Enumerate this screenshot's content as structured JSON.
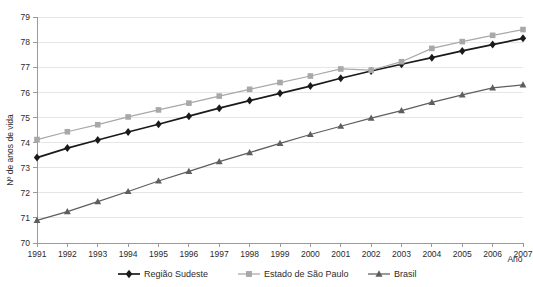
{
  "chart_data": {
    "type": "line",
    "title": "",
    "xlabel": "Ano",
    "ylabel": "Nº de anos de vida",
    "categories": [
      "1991",
      "1992",
      "1993",
      "1994",
      "1995",
      "1996",
      "1997",
      "1998",
      "1999",
      "2000",
      "2001",
      "2002",
      "2003",
      "2004",
      "2005",
      "2006",
      "2007"
    ],
    "x": [
      1991,
      1992,
      1993,
      1994,
      1995,
      1996,
      1997,
      1998,
      1999,
      2000,
      2001,
      2002,
      2003,
      2004,
      2005,
      2006,
      2007
    ],
    "ylim": [
      70,
      79
    ],
    "xlim": [
      1991,
      2007
    ],
    "yticks": [
      "70",
      "71",
      "72",
      "73",
      "74",
      "75",
      "76",
      "77",
      "78",
      "79"
    ],
    "grid": "horizontal",
    "legend_position": "bottom",
    "series": [
      {
        "name": "Região Sudeste",
        "marker": "diamond",
        "color": "#1a1a1a",
        "values": [
          73.4,
          73.78,
          74.1,
          74.42,
          74.73,
          75.05,
          75.37,
          75.67,
          75.96,
          76.25,
          76.56,
          76.85,
          77.12,
          77.38,
          77.65,
          77.9,
          78.15
        ]
      },
      {
        "name": "Estado de São Paulo",
        "marker": "square",
        "color": "#a8a8a8",
        "values": [
          74.12,
          74.43,
          74.71,
          75.02,
          75.3,
          75.57,
          75.85,
          76.12,
          76.39,
          76.65,
          76.93,
          76.88,
          77.22,
          77.75,
          78.02,
          78.27,
          78.5
        ]
      },
      {
        "name": "Brasil",
        "marker": "triangle",
        "color": "#5e5e5e",
        "values": [
          70.9,
          71.25,
          71.65,
          72.05,
          72.47,
          72.85,
          73.24,
          73.6,
          73.97,
          74.32,
          74.65,
          74.97,
          75.27,
          75.6,
          75.9,
          76.18,
          76.3
        ]
      }
    ]
  },
  "axes": {
    "y_label": "Nº de anos de vida",
    "x_label": "Ano"
  },
  "legend": {
    "items": [
      {
        "label": "Região Sudeste",
        "marker": "diamond-marker",
        "color": "#1a1a1a"
      },
      {
        "label": "Estado de São Paulo",
        "marker": "square-marker",
        "color": "#a8a8a8"
      },
      {
        "label": "Brasil",
        "marker": "triangle-marker",
        "color": "#5e5e5e"
      }
    ]
  }
}
